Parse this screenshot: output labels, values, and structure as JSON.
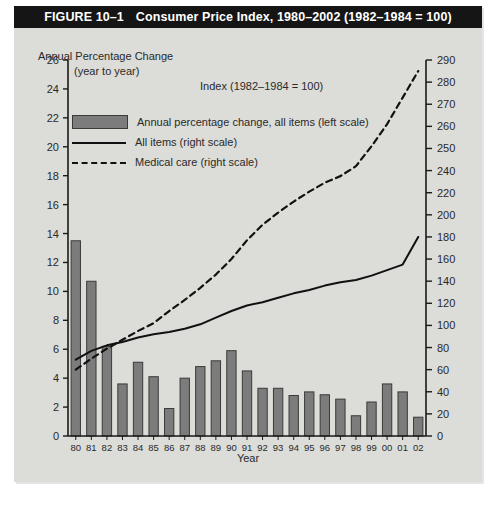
{
  "figure": {
    "number": "FIGURE 10–1",
    "title": "Consumer Price Index, 1980–2002 (1982–1984 = 100)"
  },
  "labels": {
    "left_axis_title_line1": "Annual Percentage Change",
    "left_axis_title_line2": "(year to year)",
    "index_note": "Index (1982–1984 = 100)",
    "x_axis_title": "Year"
  },
  "legend": {
    "position": "inside-top-left",
    "items": [
      {
        "key": "swatch",
        "label": "Annual percentage change, all items (left scale)"
      },
      {
        "key": "solid",
        "label": "All items (right scale)"
      },
      {
        "key": "dashed",
        "label": "Medical care (right scale)"
      }
    ]
  },
  "colors": {
    "bar_fill": "#7c7c7c",
    "bar_stroke": "#3a3a3a",
    "line_all_items": "#111111",
    "line_medical_care": "#111111",
    "panel_background": "#dcdcd8",
    "title_background": "#151515",
    "title_text": "#ffffff",
    "axis": "#1a1a1a"
  },
  "chart_data": {
    "type": "bar",
    "title": "Consumer Price Index, 1980–2002 (1982–1984 = 100)",
    "xlabel": "Year",
    "ylabel": "Annual Percentage Change (year to year)",
    "y2label": "Index (1982–1984 = 100)",
    "grid": false,
    "legend_position": "inside-top-left",
    "categories": [
      "80",
      "81",
      "82",
      "83",
      "84",
      "85",
      "86",
      "87",
      "88",
      "89",
      "90",
      "91",
      "92",
      "93",
      "94",
      "95",
      "96",
      "97",
      "98",
      "99",
      "00",
      "01",
      "02"
    ],
    "x_values": [
      1980,
      1981,
      1982,
      1983,
      1984,
      1985,
      1986,
      1987,
      1988,
      1989,
      1990,
      1991,
      1992,
      1993,
      1994,
      1995,
      1996,
      1997,
      1998,
      1999,
      2000,
      2001,
      2002
    ],
    "ylim": [
      0,
      26
    ],
    "yticks": [
      0,
      2,
      4,
      6,
      8,
      10,
      12,
      14,
      16,
      18,
      20,
      22,
      24,
      26
    ],
    "y2lim": [
      0,
      290
    ],
    "y2ticks": [
      0,
      20,
      40,
      60,
      80,
      100,
      120,
      140,
      160,
      180,
      200,
      220,
      240,
      250,
      260,
      270,
      280,
      290
    ],
    "y2_note": "Right axis spacing is uniform per tick label; ticks step by 20 up to 240, then by 10 from 240 to 290.",
    "series": [
      {
        "name": "Annual percentage change, all items (left scale)",
        "type": "bar",
        "axis": "left",
        "values": [
          13.5,
          10.7,
          6.2,
          3.6,
          5.1,
          4.1,
          1.9,
          4.0,
          4.8,
          5.2,
          5.9,
          4.5,
          3.3,
          3.3,
          2.8,
          3.05,
          2.85,
          2.55,
          1.4,
          2.35,
          3.6,
          3.05,
          1.3
        ]
      },
      {
        "name": "All items (right scale)",
        "type": "line",
        "style": "solid",
        "axis": "right",
        "values": [
          69,
          77,
          82,
          85,
          89,
          92,
          94,
          97,
          101,
          107,
          113,
          118,
          121,
          125,
          129,
          132,
          136,
          139,
          141,
          145,
          150,
          155,
          180
        ]
      },
      {
        "name": "Medical care (right scale)",
        "type": "line",
        "style": "dashed",
        "axis": "right",
        "values": [
          60,
          70,
          79,
          87,
          95,
          102,
          113,
          123,
          134,
          146,
          160,
          177,
          191,
          202,
          212,
          221,
          229,
          235,
          242,
          251,
          261,
          273,
          285
        ]
      }
    ]
  }
}
